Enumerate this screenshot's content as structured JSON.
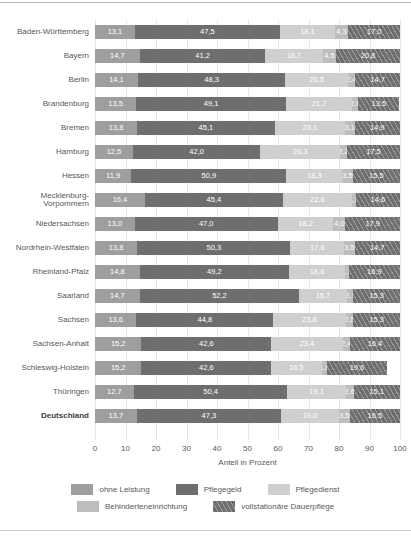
{
  "chart_data": {
    "type": "bar",
    "orientation": "horizontal",
    "stacked": true,
    "stacked_mode": "percent",
    "title": "",
    "xlabel": "Anteil in Prozent",
    "ylabel": "",
    "xlim": [
      0,
      100
    ],
    "xticks": [
      "0",
      "10",
      "20",
      "30",
      "40",
      "50",
      "60",
      "70",
      "80",
      "90",
      "100"
    ],
    "grid": true,
    "legend_position": "bottom",
    "categories": [
      "Baden-Württemberg",
      "Bayern",
      "Berlin",
      "Brandenburg",
      "Bremen",
      "Hamburg",
      "Hessen",
      "Mecklenburg-\nVorpommern",
      "Niedersachsen",
      "Nordrhein-Westfalen",
      "Rheinland-Pfalz",
      "Saarland",
      "Sachsen",
      "Sachsen-Anhalt",
      "Schleswig-Holstein",
      "Thüringen",
      "Deutschland"
    ],
    "emphasized_category": "Deutschland",
    "series": [
      {
        "name": "ohne Leistung",
        "color": "#9e9e9e",
        "values": [
          13.1,
          14.7,
          14.1,
          13.5,
          13.8,
          12.5,
          11.9,
          16.4,
          13.0,
          13.8,
          14.8,
          14.7,
          13.6,
          15.2,
          15.2,
          12.7,
          13.7
        ],
        "labels": [
          "13,1",
          "14,7",
          "14,1",
          "13,5",
          "13,8",
          "12,5",
          "11,9",
          "16,4",
          "13,0",
          "13,8",
          "14,8",
          "14,7",
          "13,6",
          "15,2",
          "15,2",
          "12,7",
          "13,7"
        ]
      },
      {
        "name": "Pflegegeld",
        "color": "#6e6e6e",
        "values": [
          47.5,
          41.2,
          48.3,
          49.1,
          45.1,
          42.0,
          50.9,
          45.4,
          47.0,
          50.3,
          49.2,
          52.2,
          44.8,
          42.6,
          42.6,
          50.4,
          47.3
        ],
        "labels": [
          "47,5",
          "41,2",
          "48,3",
          "49,1",
          "45,1",
          "42,0",
          "50,9",
          "45,4",
          "47,0",
          "50,3",
          "49,2",
          "52,2",
          "44,8",
          "42,6",
          "42,6",
          "50,4",
          "47,3"
        ]
      },
      {
        "name": "Pflegedienst",
        "color": "#cfcfcf",
        "values": [
          18.1,
          18.7,
          20.5,
          21.7,
          23.1,
          26.3,
          18.3,
          22.6,
          18.2,
          17.6,
          18.6,
          15.7,
          23.8,
          23.4,
          16.5,
          19.1,
          19.0
        ],
        "labels": [
          "18,1",
          "18,7",
          "20,5",
          "21,7",
          "23,1",
          "26,3",
          "18,3",
          "22,6",
          "18,2",
          "17,6",
          "18,6",
          "15,7",
          "23,8",
          "23,4",
          "16,5",
          "19,1",
          "19,0"
        ]
      },
      {
        "name": "Behinderteneinrichtung",
        "color": "#bdbdbd",
        "values": [
          4.3,
          4.5,
          2.4,
          2.0,
          3.1,
          2.2,
          3.5,
          1.3,
          4.0,
          3.5,
          1.2,
          2.1,
          2.5,
          2.4,
          1.8,
          2.6,
          3.5
        ],
        "labels": [
          "4,3",
          "4,5",
          "2,4",
          "2,0",
          "3,1",
          "2,2",
          "3,5",
          "1,3",
          "4,0",
          "3,5",
          "1,2",
          "2,1",
          "2,5",
          "2,4",
          "1,8",
          "2,6",
          "3,5"
        ]
      },
      {
        "name": "vollstationäre Dauerpflege",
        "color": "#6e6e6e",
        "hatch": "diagonal",
        "values": [
          17.0,
          20.8,
          14.7,
          13.5,
          14.9,
          17.5,
          15.5,
          14.6,
          17.9,
          14.7,
          16.9,
          15.3,
          15.3,
          16.4,
          19.6,
          15.1,
          16.5
        ],
        "labels": [
          "17,0",
          "20,8",
          "14,7",
          "13,5",
          "14,9",
          "17,5",
          "15,5",
          "14,6",
          "17,9",
          "14,7",
          "16,9",
          "15,3",
          "15,3",
          "16,4",
          "19,6",
          "15,1",
          "16,5"
        ]
      }
    ]
  }
}
